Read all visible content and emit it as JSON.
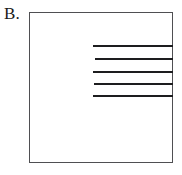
{
  "figure": {
    "panel_label": "B.",
    "background_color": "#ffffff",
    "box": {
      "border_color": "#4f4f52",
      "fill_color": "#ffffff",
      "x": 29,
      "y": 12,
      "width": 144,
      "height": 151
    },
    "line_color": "#1d1d1f"
  },
  "chart_data": {
    "type": "line",
    "title": "B.",
    "xlabel": "",
    "ylabel": "",
    "grid": false,
    "legend": null,
    "axis_ranges": {
      "x": [
        29,
        173
      ],
      "y": [
        12,
        163
      ]
    },
    "series": [
      {
        "name": "segment-1",
        "x_start": 93,
        "x_end": 173,
        "y": 45,
        "thickness": 2
      },
      {
        "name": "segment-2",
        "x_start": 95,
        "x_end": 173,
        "y": 58,
        "thickness": 2
      },
      {
        "name": "segment-3",
        "x_start": 93,
        "x_end": 173,
        "y": 71,
        "thickness": 2
      },
      {
        "name": "segment-4",
        "x_start": 94,
        "x_end": 173,
        "y": 83,
        "thickness": 2
      },
      {
        "name": "segment-5",
        "x_start": 93,
        "x_end": 173,
        "y": 95,
        "thickness": 2
      }
    ]
  }
}
